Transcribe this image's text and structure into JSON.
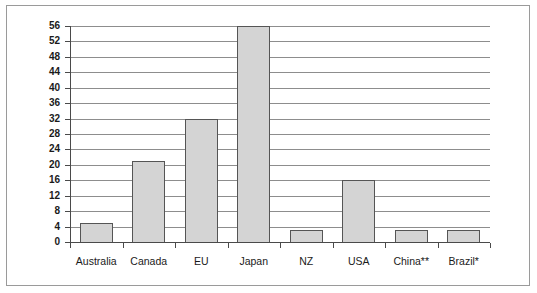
{
  "chart_data": {
    "type": "bar",
    "title": "",
    "subtitle": "",
    "xlabel": "",
    "ylabel": "",
    "categories": [
      "Australia",
      "Canada",
      "EU",
      "Japan",
      "NZ",
      "USA",
      "China**",
      "Brazil*"
    ],
    "values": [
      5,
      21,
      32,
      56,
      3,
      16,
      3,
      3
    ],
    "ylim": [
      0,
      56
    ],
    "ytick_step": 4,
    "ytick_labels": [
      "0",
      "4",
      "8",
      "12",
      "16",
      "20",
      "24",
      "28",
      "32",
      "36",
      "40",
      "44",
      "48",
      "52",
      "56"
    ],
    "grid": true,
    "grid_axis": "y",
    "legend": false,
    "legend_position": "none",
    "annotations": [],
    "series": [
      {
        "name": "",
        "values": [
          5,
          21,
          32,
          56,
          3,
          16,
          3,
          3
        ]
      }
    ]
  },
  "style": {
    "bar_fill": "#d4d4d4",
    "bar_edge": "#555555",
    "grid_color": "#8d8d8d",
    "axis_color": "#4a4a4a",
    "frame_color": "#9a9a9a",
    "background": "#ffffff",
    "text_color": "#1a1a1a"
  }
}
